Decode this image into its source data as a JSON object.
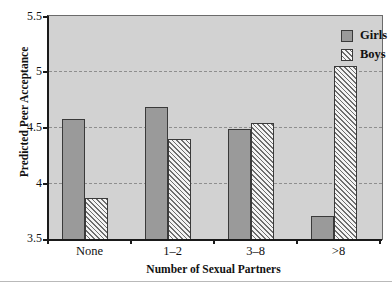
{
  "chart_data": {
    "type": "bar",
    "title": "",
    "xlabel": "Number of Sexual Partners",
    "ylabel": "Predicted Peer Acceptance",
    "categories": [
      "None",
      "1–2",
      "3–8",
      ">8"
    ],
    "series": [
      {
        "name": "Girls",
        "values": [
          4.59,
          4.69,
          4.5,
          3.72
        ],
        "color": "#9a9a9a",
        "fill": "solid"
      },
      {
        "name": "Boys",
        "values": [
          3.88,
          4.41,
          4.55,
          5.06
        ],
        "color": "#f4f4f4",
        "fill": "diagonal-hatch"
      }
    ],
    "ylim": [
      3.5,
      5.5
    ],
    "yticks": [
      "3.5",
      "4",
      "4.5",
      "5",
      "5.5"
    ],
    "ytick_values": [
      3.5,
      4,
      4.5,
      5,
      5.5
    ],
    "grid": true,
    "grid_style": "dashed",
    "legend_position": "top-right",
    "plot_background": "#d2d2d2"
  },
  "legend": {
    "items": [
      {
        "label": "Girls",
        "swatch": "solid-gray-swatch"
      },
      {
        "label": "Boys",
        "swatch": "hatched-swatch"
      }
    ]
  },
  "axes": {
    "y_title": "Predicted Peer Acceptance",
    "x_title": "Number of Sexual Partners",
    "y_tick_labels": [
      "5.5",
      "5",
      "4.5",
      "4",
      "3.5"
    ],
    "x_tick_labels": [
      "None",
      "1–2",
      "3–8",
      ">8"
    ]
  }
}
